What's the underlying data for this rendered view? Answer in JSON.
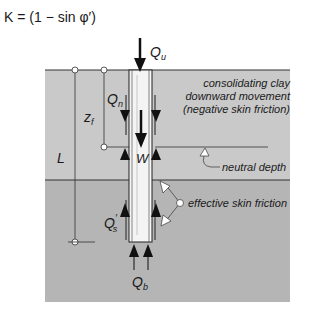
{
  "equation": "K = (1 − sin φ′)",
  "labels": {
    "Qu_main": "Q",
    "Qu_sub": "u",
    "Qn_main": "Q",
    "Qn_sub": "n",
    "zf_main": "z",
    "zf_sub": "f",
    "L": "L",
    "W": "W",
    "Qs_main": "Q",
    "Qs_prime": "′",
    "Qs_sub": "s",
    "Qb_main": "Q",
    "Qb_sub": "b"
  },
  "annotations": {
    "clay_line1": "consolidating clay",
    "clay_line2": "downward movement",
    "clay_line3": "(negative skin friction)",
    "neutral_depth": "neutral depth",
    "effective_skin_friction": "effective skin friction"
  },
  "colors": {
    "upper_layer": "#c9c9c9",
    "lower_layer": "#b5b5b5",
    "pile": "#f4f4f4",
    "lines": "#1a1a1a"
  }
}
